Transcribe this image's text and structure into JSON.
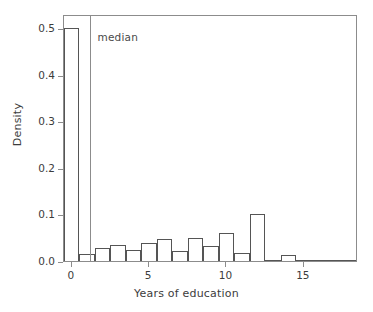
{
  "chart_data": {
    "type": "bar",
    "title": "",
    "subtitle": "",
    "xlabel": "Years of education",
    "ylabel": "Density",
    "xlim": [
      -0.5,
      18.5
    ],
    "ylim": [
      0.0,
      0.53
    ],
    "grid": false,
    "legend": null,
    "bin_width": 1,
    "x_ticks": [
      0,
      5,
      10,
      15
    ],
    "x_tick_labels": [
      "0",
      "5",
      "10",
      "15"
    ],
    "y_ticks": [
      0.0,
      0.1,
      0.2,
      0.3,
      0.4,
      0.5
    ],
    "y_tick_labels": [
      "0.0",
      "0.1",
      "0.2",
      "0.3",
      "0.4",
      "0.5"
    ],
    "bin_centers": [
      0,
      1,
      2,
      3,
      4,
      5,
      6,
      7,
      8,
      9,
      10,
      11,
      12,
      13,
      14,
      15,
      16,
      17,
      18
    ],
    "categories": [
      "0",
      "1",
      "2",
      "3",
      "4",
      "5",
      "6",
      "7",
      "8",
      "9",
      "10",
      "11",
      "12",
      "13",
      "14",
      "15",
      "16",
      "17",
      "18"
    ],
    "values": [
      0.5,
      0.014,
      0.027,
      0.035,
      0.024,
      0.039,
      0.047,
      0.021,
      0.05,
      0.032,
      0.06,
      0.017,
      0.1,
      0.001,
      0.013,
      0.0,
      0.002,
      0.0,
      0.001
    ],
    "annotations": [
      {
        "name": "median",
        "label": "median",
        "type": "vline",
        "x": 1.15,
        "color": "#8c8c8c"
      }
    ],
    "colors": {
      "bar_edge": "#555555",
      "bar_fill": "transparent",
      "frame": "#8c8c8c",
      "text": "#3c3c3c",
      "background": "#ffffff"
    }
  },
  "axes": {
    "y_label": "Density",
    "x_label": "Years of education"
  }
}
